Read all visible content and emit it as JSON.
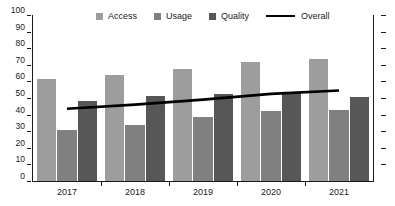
{
  "chart_data": {
    "type": "bar",
    "title": "",
    "xlabel": "",
    "ylabel": "",
    "ylim": [
      0,
      100
    ],
    "ytick_values": [
      0,
      10,
      20,
      30,
      40,
      50,
      60,
      70,
      80,
      90,
      100
    ],
    "ytick_labels": [
      "0",
      "10",
      "20",
      "30",
      "40",
      "50",
      "60",
      "70",
      "80",
      "90",
      "100"
    ],
    "categories": [
      "2017",
      "2018",
      "2019",
      "2020",
      "2021"
    ],
    "grid": false,
    "legend_position": "top-center",
    "right_axis_ticks": true,
    "right_axis_labels": [],
    "series": [
      {
        "name": "Access",
        "type": "bar",
        "color": "#9d9d9d",
        "values": [
          61.5,
          64.0,
          67.5,
          71.5,
          73.5
        ]
      },
      {
        "name": "Usage",
        "type": "bar",
        "color": "#808080",
        "values": [
          30.5,
          33.5,
          38.5,
          42.0,
          43.0
        ]
      },
      {
        "name": "Quality",
        "type": "bar",
        "color": "#575757",
        "values": [
          48.5,
          51.0,
          52.5,
          53.5,
          50.5
        ]
      },
      {
        "name": "Overall",
        "type": "line",
        "color": "#000000",
        "values": [
          43.5,
          46.0,
          49.0,
          52.5,
          54.5
        ]
      }
    ]
  },
  "legend": {
    "items": [
      {
        "label": "Access",
        "marker": "square",
        "color": "#9d9d9d"
      },
      {
        "label": "Usage",
        "marker": "square",
        "color": "#808080"
      },
      {
        "label": "Quality",
        "marker": "square",
        "color": "#575757"
      },
      {
        "label": "Overall",
        "marker": "line",
        "color": "#000000"
      }
    ]
  }
}
